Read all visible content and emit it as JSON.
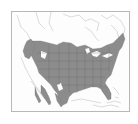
{
  "map": {
    "type": "range-map",
    "region": "North America",
    "shaded_area": "Contiguous United States (central, eastern and Pacific northwest), southern Canada fringe, western Mexico strips",
    "colors": {
      "background": "#ffffff",
      "frame": "#b8b8b8",
      "land": "#fdfdfd",
      "outline": "#c4c4c4",
      "range_fill": "#8c8c8c",
      "state_lines": "#6e6e6e"
    }
  }
}
